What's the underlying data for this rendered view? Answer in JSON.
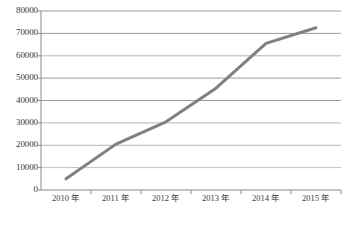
{
  "chart_data": {
    "type": "line",
    "title": "",
    "subtitle": "",
    "xlabel": "",
    "ylabel": "",
    "categories": [
      "2010 年",
      "2011 年",
      "2012 年",
      "2013 年",
      "2014 年",
      "2015 年"
    ],
    "series": [
      {
        "name": "series-1",
        "values": [
          5000,
          20500,
          30500,
          45500,
          65500,
          72500
        ],
        "color": "#808080"
      }
    ],
    "ylim": [
      0,
      80000
    ],
    "yticks": [
      0,
      10000,
      20000,
      30000,
      40000,
      50000,
      60000,
      70000,
      80000
    ],
    "ytick_labels": [
      "0",
      "10000",
      "20000",
      "30000",
      "40000",
      "50000",
      "60000",
      "70000",
      "80000"
    ],
    "xtick_labels": [
      "2010 年",
      "2011 年",
      "2012 年",
      "2013 年",
      "2014 年",
      "2015 年"
    ],
    "grid": true,
    "grid_axis": "y",
    "legend": false,
    "legend_position": "none",
    "markers": false,
    "line_width": 3,
    "colors": {
      "line": "#808080",
      "grid": "#a6a6a6",
      "axis": "#808080",
      "text": "#3a3a3a",
      "background": "#ffffff"
    }
  }
}
